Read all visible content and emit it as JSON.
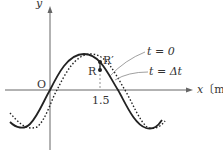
{
  "diagram": {
    "type": "transverse wave snapshot",
    "axes": {
      "y_label": "y",
      "x_label": "x〔m〕",
      "origin_label": "O",
      "x_tick": "1.5"
    },
    "points": [
      {
        "name": "R",
        "label": "R"
      },
      {
        "name": "R_prime",
        "label": "R′"
      }
    ],
    "curves": [
      {
        "name": "solid",
        "style": "solid",
        "label": "t = 0"
      },
      {
        "name": "dotted",
        "style": "dotted",
        "label": "t = Δt"
      }
    ],
    "colors": {
      "line": "#222222",
      "axis": "#555555",
      "leader": "#777777"
    }
  }
}
